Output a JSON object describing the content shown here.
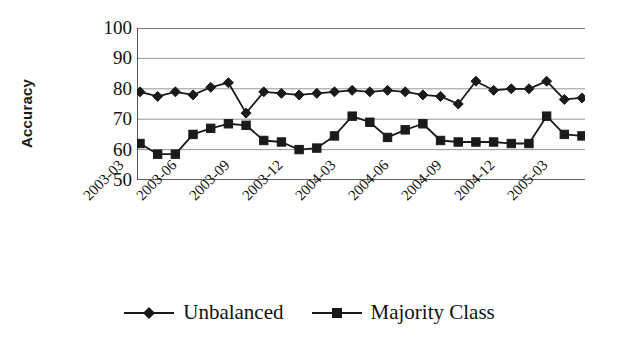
{
  "chart_data": {
    "type": "line",
    "title": "",
    "xlabel": "",
    "ylabel": "Accuracy",
    "ylim": [
      50,
      100
    ],
    "yticks": [
      50,
      60,
      70,
      80,
      90,
      100
    ],
    "grid": true,
    "legend_position": "bottom",
    "x": [
      "2003-03",
      "2003-04",
      "2003-05",
      "2003-06",
      "2003-07",
      "2003-08",
      "2003-09",
      "2003-10",
      "2003-11",
      "2003-12",
      "2004-01",
      "2004-02",
      "2004-03",
      "2004-04",
      "2004-05",
      "2004-06",
      "2004-07",
      "2004-08",
      "2004-09",
      "2004-10",
      "2004-11",
      "2004-12",
      "2005-01",
      "2005-02",
      "2005-03",
      "2005-04"
    ],
    "xtick_labels": [
      "2003-03",
      "2003-06",
      "2003-09",
      "2003-12",
      "2004-03",
      "2004-06",
      "2004-09",
      "2004-12",
      "2005-03"
    ],
    "xtick_indices": [
      0,
      3,
      6,
      9,
      12,
      15,
      18,
      21,
      24
    ],
    "series": [
      {
        "name": "Unbalanced",
        "marker": "diamond",
        "color": "#1a1a1a",
        "values": [
          79,
          77.5,
          79,
          78,
          80.5,
          82,
          72,
          79,
          78.5,
          78,
          78.5,
          79,
          79.5,
          79,
          79.5,
          79,
          78,
          77.5,
          75,
          82.5,
          79.5,
          80,
          80,
          82.5,
          76.5,
          77
        ]
      },
      {
        "name": "Majority Class",
        "marker": "square",
        "color": "#1a1a1a",
        "values": [
          62,
          58.5,
          58.5,
          65,
          67,
          68.5,
          68,
          63,
          62.5,
          60,
          60.5,
          64.5,
          71,
          69,
          64,
          66.5,
          68.5,
          63,
          62.5,
          62.5,
          62.5,
          62,
          62,
          71,
          65,
          64.5
        ]
      }
    ]
  },
  "legend": {
    "items": [
      {
        "label": "Unbalanced",
        "marker": "diamond"
      },
      {
        "label": "Majority Class",
        "marker": "square"
      }
    ]
  }
}
